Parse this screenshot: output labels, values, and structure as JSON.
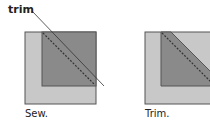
{
  "labels": {
    "trim_callout": "trim",
    "left_caption": "Sew.",
    "right_caption": "Trim."
  },
  "colors": {
    "outer_fill": "#c8c8c8",
    "inner_fill": "#8a8a8a",
    "border": "#555555",
    "line": "#333333",
    "background": "#ffffff"
  },
  "panels": [
    {
      "name": "sew",
      "caption": "Sew."
    },
    {
      "name": "trim",
      "caption": "Trim."
    }
  ]
}
